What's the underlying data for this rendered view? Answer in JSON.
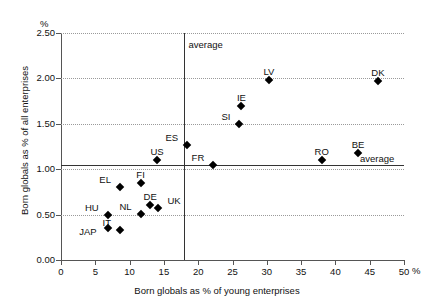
{
  "chart_data": {
    "type": "scatter",
    "title": "",
    "xlabel": "Born globals as % of young enterprises",
    "ylabel": "Born globals as % of all enterprises",
    "x_unit": "%",
    "y_unit": "%",
    "xlim": [
      0,
      50
    ],
    "ylim": [
      0.0,
      2.5
    ],
    "xticks": [
      "0",
      "5",
      "10",
      "15",
      "20",
      "25",
      "30",
      "35",
      "40",
      "45",
      "50"
    ],
    "xtick_values": [
      0,
      5,
      10,
      15,
      20,
      25,
      30,
      35,
      40,
      45,
      50
    ],
    "yticks": [
      "0.00",
      "0.50",
      "1.00",
      "1.50",
      "2.00",
      "2.50"
    ],
    "ytick_values": [
      0.0,
      0.5,
      1.0,
      1.5,
      2.0,
      2.5
    ],
    "grid": "horizontal-dotted",
    "legend": "none",
    "reference_lines": [
      {
        "orientation": "vertical",
        "value": 18.0,
        "label": "average",
        "label_side": "right-top"
      },
      {
        "orientation": "horizontal",
        "value": 1.05,
        "label": "average",
        "label_side": "right"
      }
    ],
    "points": [
      {
        "label": "JAP",
        "x": 6.8,
        "y": 0.35,
        "label_pos": "left"
      },
      {
        "label": "HU",
        "x": 6.8,
        "y": 0.5,
        "label_pos": "above-left"
      },
      {
        "label": "IT",
        "x": 8.6,
        "y": 0.33,
        "label_pos": "above-left"
      },
      {
        "label": "EL",
        "x": 8.6,
        "y": 0.8,
        "label_pos": "above-left"
      },
      {
        "label": "FI",
        "x": 11.6,
        "y": 0.85,
        "label_pos": "above"
      },
      {
        "label": "NL",
        "x": 11.6,
        "y": 0.51,
        "label_pos": "above-left"
      },
      {
        "label": "DE",
        "x": 13.0,
        "y": 0.61,
        "label_pos": "above"
      },
      {
        "label": "UK",
        "x": 14.2,
        "y": 0.57,
        "label_pos": "above-right"
      },
      {
        "label": "US",
        "x": 14.0,
        "y": 1.1,
        "label_pos": "above"
      },
      {
        "label": "ES",
        "x": 18.4,
        "y": 1.27,
        "label_pos": "above-left"
      },
      {
        "label": "FR",
        "x": 22.2,
        "y": 1.05,
        "label_pos": "above-left"
      },
      {
        "label": "SI",
        "x": 26.0,
        "y": 1.5,
        "label_pos": "above-left"
      },
      {
        "label": "IE",
        "x": 26.3,
        "y": 1.7,
        "label_pos": "above"
      },
      {
        "label": "LV",
        "x": 30.3,
        "y": 1.98,
        "label_pos": "above"
      },
      {
        "label": "RO",
        "x": 38.0,
        "y": 1.1,
        "label_pos": "above"
      },
      {
        "label": "BE",
        "x": 43.3,
        "y": 1.18,
        "label_pos": "above"
      },
      {
        "label": "DK",
        "x": 46.2,
        "y": 1.97,
        "label_pos": "above"
      }
    ]
  }
}
